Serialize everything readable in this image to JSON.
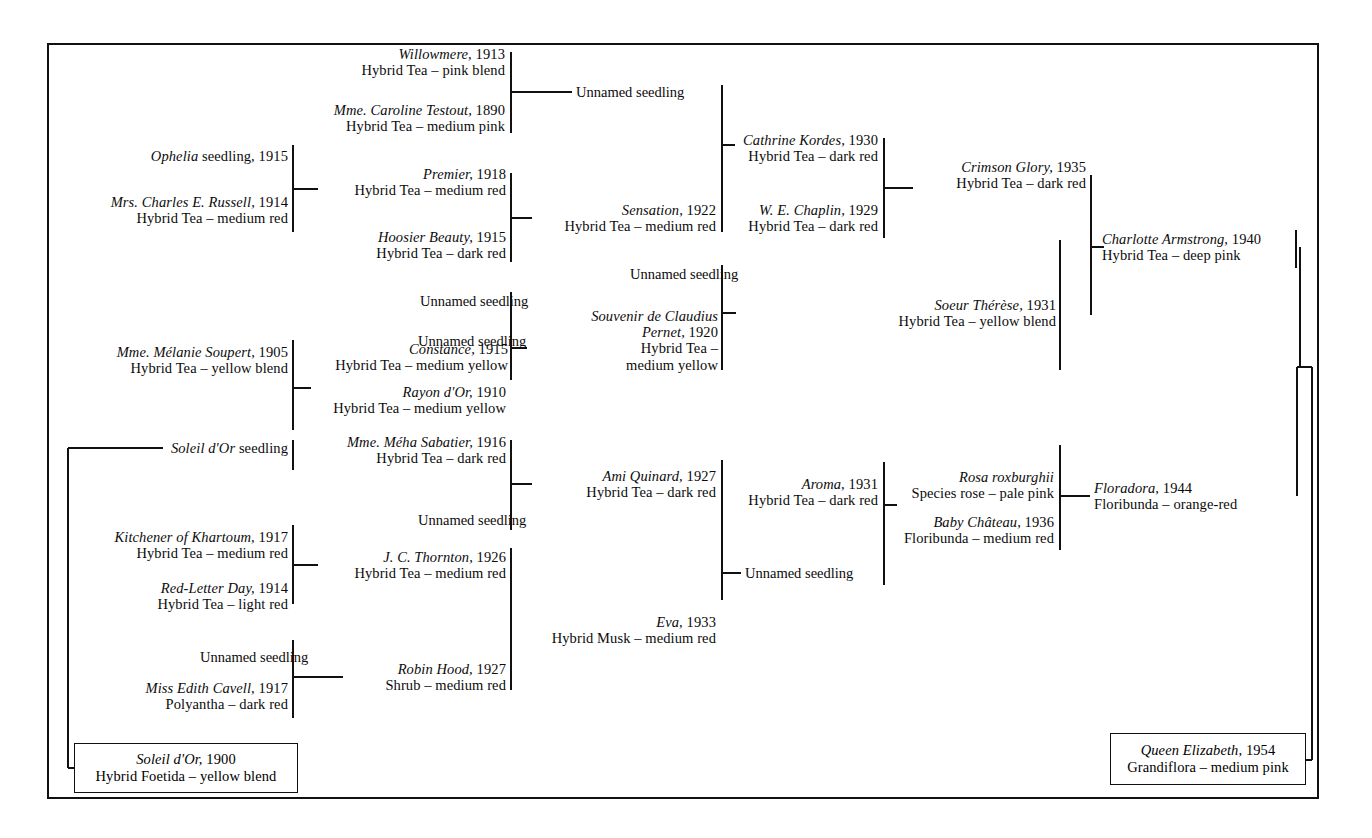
{
  "chart": {
    "type": "pedigree-tree",
    "top_note": "",
    "frame": {
      "x": 48,
      "y": 44,
      "width": 1270,
      "height": 754,
      "stroke": "#111111"
    },
    "line_color": "#111111",
    "text_color": "#0b0b0b"
  },
  "nodes": {
    "willowmere": {
      "name": "Willowmere,",
      "year": "1913",
      "cls": "Hybrid Tea – pink blend"
    },
    "testout": {
      "name": "Mme. Caroline Testout,",
      "year": "1890",
      "cls": "Hybrid Tea – medium pink"
    },
    "unnamed_top": {
      "name": "",
      "year": "",
      "cls": "Unnamed seedling"
    },
    "ophelia": {
      "name": "Ophelia",
      "year": "1915",
      "cls": "",
      "label_rom": "seedling,"
    },
    "russell": {
      "name": "Mrs. Charles E. Russell,",
      "year": "1914",
      "cls": "Hybrid Tea – medium red"
    },
    "premier": {
      "name": "Premier,",
      "year": "1918",
      "cls": "Hybrid Tea – medium red"
    },
    "hoosier": {
      "name": "Hoosier Beauty,",
      "year": "1915",
      "cls": "Hybrid Tea – dark red"
    },
    "sensation": {
      "name": "Sensation,",
      "year": "1922",
      "cls": "Hybrid Tea – medium red"
    },
    "cathrine": {
      "name": "Cathrine Kordes,",
      "year": "1930",
      "cls": "Hybrid Tea – dark red"
    },
    "chaplin": {
      "name": "W. E. Chaplin,",
      "year": "1929",
      "cls": "Hybrid Tea – dark red"
    },
    "crimson": {
      "name": "Crimson Glory,",
      "year": "1935",
      "cls": "Hybrid Tea – dark red"
    },
    "charlotte": {
      "name": "Charlotte Armstrong,",
      "year": "1940",
      "cls": "Hybrid Tea – deep pink"
    },
    "unnamed_scp": {
      "name": "",
      "year": "",
      "cls": "Unnamed seedling"
    },
    "claudius": {
      "name": "Souvenir de Claudius",
      "year": "1920",
      "cls": "Hybrid Tea –",
      "name2": "Pernet,",
      "cls2": "medium yellow"
    },
    "soeur": {
      "name": "Soeur Thérèse,",
      "year": "1931",
      "cls": "Hybrid Tea – yellow blend"
    },
    "unnamed_con": {
      "name": "",
      "year": "",
      "cls": "Unnamed seedling"
    },
    "constance": {
      "name": "Constance,",
      "year": "1915",
      "cls": "Hybrid Tea – medium yellow"
    },
    "soupert": {
      "name": "Mme. Mélanie Soupert,",
      "year": "1905",
      "cls": "Hybrid Tea – yellow blend"
    },
    "rayon": {
      "name": "Rayon d'Or,",
      "year": "1910",
      "cls": "Hybrid Tea – medium yellow"
    },
    "soleil_sdl": {
      "name": "Soleil d'Or",
      "year": "",
      "cls": "",
      "label_rom": "seedling"
    },
    "sabatier": {
      "name": "Mme. Méha Sabatier,",
      "year": "1916",
      "cls": "Hybrid Tea – dark red"
    },
    "unnamed_ami": {
      "name": "",
      "year": "",
      "cls": "Unnamed seedling"
    },
    "ami": {
      "name": "Ami Quinard,",
      "year": "1927",
      "cls": "Hybrid Tea – dark red"
    },
    "aroma": {
      "name": "Aroma,",
      "year": "1931",
      "cls": "Hybrid Tea – dark red"
    },
    "roxburghii": {
      "name": "Rosa roxburghii",
      "year": "",
      "cls": "Species rose – pale pink"
    },
    "baby": {
      "name": "Baby Château,",
      "year": "1936",
      "cls": "Floribunda – medium red"
    },
    "floradora": {
      "name": "Floradora,",
      "year": "1944",
      "cls": "Floribunda – orange-red"
    },
    "unnamed_aro": {
      "name": "",
      "year": "",
      "cls": "Unnamed seedling"
    },
    "kitchener": {
      "name": "Kitchener of Khartoum,",
      "year": "1917",
      "cls": "Hybrid Tea – medium red"
    },
    "redletter": {
      "name": "Red-Letter Day,",
      "year": "1914",
      "cls": "Hybrid Tea – light red"
    },
    "thornton": {
      "name": "J. C. Thornton,",
      "year": "1926",
      "cls": "Hybrid Tea – medium red"
    },
    "eva": {
      "name": "Eva,",
      "year": "1933",
      "cls": "Hybrid Musk – medium red"
    },
    "unnamed_rh": {
      "name": "",
      "year": "",
      "cls": "Unnamed seedling"
    },
    "cavell": {
      "name": "Miss Edith Cavell,",
      "year": "1917",
      "cls": "Polyantha – dark red"
    },
    "robinhood": {
      "name": "Robin Hood,",
      "year": "1927",
      "cls": "Shrub – medium red"
    },
    "soleil": {
      "name": "Soleil d'Or,",
      "year": "1900",
      "cls": "Hybrid Foetida – yellow blend"
    },
    "queen": {
      "name": "Queen Elizabeth,",
      "year": "1954",
      "cls": "Grandiflora – medium pink"
    }
  }
}
